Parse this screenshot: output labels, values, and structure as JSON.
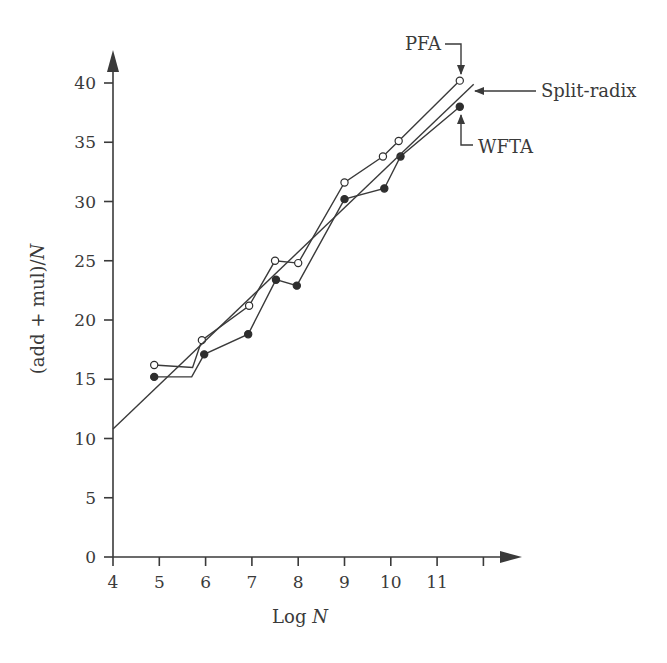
{
  "chart_data": {
    "type": "line",
    "title": "",
    "xlabel": "Log N",
    "ylabel": "(add + mul)/N",
    "xlim": [
      4,
      12.3
    ],
    "ylim": [
      0,
      42
    ],
    "x_ticks": [
      4,
      5,
      6,
      7,
      8,
      9,
      10,
      11,
      12
    ],
    "x_tick_labels": [
      "4",
      "5",
      "6",
      "7",
      "8",
      "9",
      "10",
      "11",
      ""
    ],
    "y_ticks": [
      0,
      5,
      10,
      15,
      20,
      25,
      30,
      35,
      40
    ],
    "y_tick_labels": [
      "0",
      "5",
      "10",
      "15",
      "20",
      "25",
      "30",
      "35",
      "40"
    ],
    "grid": false,
    "legend": "none (series labelled by arrow annotations)",
    "series": [
      {
        "name": "PFA",
        "marker": "open-circle",
        "points": [
          {
            "x": 4.89,
            "y": 16.2,
            "marker": true
          },
          {
            "x": 5.72,
            "y": 16.0,
            "marker": false
          },
          {
            "x": 5.92,
            "y": 18.3,
            "marker": true
          },
          {
            "x": 6.94,
            "y": 21.2,
            "marker": true
          },
          {
            "x": 7.5,
            "y": 25.0,
            "marker": true
          },
          {
            "x": 8.0,
            "y": 24.8,
            "marker": true
          },
          {
            "x": 9.0,
            "y": 31.6,
            "marker": true
          },
          {
            "x": 9.83,
            "y": 33.8,
            "marker": true
          },
          {
            "x": 10.17,
            "y": 35.1,
            "marker": true
          },
          {
            "x": 11.49,
            "y": 40.2,
            "marker": true
          }
        ]
      },
      {
        "name": "WFTA",
        "marker": "filled-circle",
        "points": [
          {
            "x": 4.89,
            "y": 15.2,
            "marker": true
          },
          {
            "x": 5.7,
            "y": 15.2,
            "marker": false
          },
          {
            "x": 5.97,
            "y": 17.1,
            "marker": true
          },
          {
            "x": 6.92,
            "y": 18.8,
            "marker": true
          },
          {
            "x": 7.52,
            "y": 23.4,
            "marker": true
          },
          {
            "x": 7.97,
            "y": 22.9,
            "marker": true
          },
          {
            "x": 9.0,
            "y": 30.2,
            "marker": true
          },
          {
            "x": 9.86,
            "y": 31.1,
            "marker": true
          },
          {
            "x": 10.21,
            "y": 33.8,
            "marker": true
          },
          {
            "x": 11.49,
            "y": 38.0,
            "marker": true
          }
        ]
      },
      {
        "name": "Split-radix",
        "marker": "none",
        "points": [
          {
            "x": 4.0,
            "y": 10.8,
            "marker": false
          },
          {
            "x": 11.79,
            "y": 39.9,
            "marker": false
          }
        ]
      }
    ],
    "annotations": [
      {
        "text": "PFA",
        "target_series": "PFA",
        "arrow": "down"
      },
      {
        "text": "Split-radix",
        "target_series": "Split-radix",
        "arrow": "left"
      },
      {
        "text": "WFTA",
        "target_series": "WFTA",
        "arrow": "up"
      }
    ]
  }
}
